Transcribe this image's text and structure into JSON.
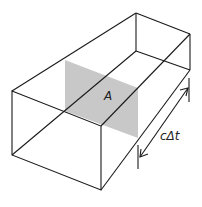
{
  "diagram": {
    "area_label": "A",
    "length_label": "cΔt",
    "shade_color": "#c8c8c8",
    "line_color": "#1a1a1a"
  }
}
